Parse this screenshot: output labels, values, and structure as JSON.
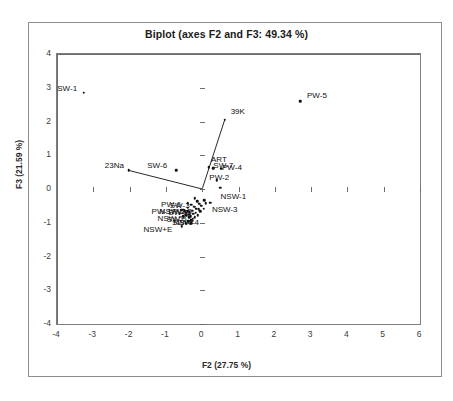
{
  "chart_data": {
    "type": "scatter",
    "title": "Biplot (axes F2 and F3: 49.34 %)",
    "xlabel": "F2 (27.75 %)",
    "ylabel": "F3 (21.59 %)",
    "xlim": [
      -4,
      6
    ],
    "ylim": [
      -4,
      4
    ],
    "xticks": [
      "-4",
      "-3",
      "-2",
      "-1",
      "0",
      "1",
      "2",
      "3",
      "4",
      "5",
      "6"
    ],
    "xtick_values": [
      -4,
      -3,
      -2,
      -1,
      0,
      1,
      2,
      3,
      4,
      5,
      6
    ],
    "yticks": [
      "4",
      "3",
      "2",
      "1",
      "0",
      "-1",
      "-2",
      "-3",
      "-4"
    ],
    "ytick_values": [
      4,
      3,
      2,
      1,
      0,
      -1,
      -2,
      -3,
      -4
    ],
    "grid": false,
    "legend": "none",
    "observations": [
      {
        "label": "SW-1",
        "x": -3.26,
        "y": 2.85,
        "lx": -3.72,
        "ly": 3.0,
        "anchor": "left"
      },
      {
        "label": "PW-5",
        "x": 2.7,
        "y": 2.6,
        "lx": 3.16,
        "ly": 2.8,
        "anchor": "left"
      },
      {
        "label": "SW-6",
        "x": -0.72,
        "y": 0.56,
        "lx": -1.24,
        "ly": 0.7,
        "anchor": "left"
      },
      {
        "label": "ART",
        "x": 0.18,
        "y": 0.65,
        "lx": 0.46,
        "ly": 0.88,
        "anchor": "left"
      },
      {
        "label": "SW-7",
        "x": 0.3,
        "y": 0.62,
        "lx": 0.58,
        "ly": 0.71,
        "anchor": "left"
      },
      {
        "label": "PW-4",
        "x": 0.52,
        "y": 0.6,
        "lx": 0.82,
        "ly": 0.66,
        "anchor": "left"
      },
      {
        "label": "PW-2",
        "x": 0.4,
        "y": 0.26,
        "lx": 0.47,
        "ly": 0.37,
        "anchor": "left"
      },
      {
        "label": "NSW-1",
        "x": 0.5,
        "y": 0.04,
        "lx": 0.86,
        "ly": -0.22,
        "anchor": "left"
      },
      {
        "label": "NSW-3",
        "x": 0.22,
        "y": -0.4,
        "lx": 0.62,
        "ly": -0.6,
        "anchor": "left"
      },
      {
        "label": "PW-6",
        "x": -0.4,
        "y": -0.42,
        "lx": -0.86,
        "ly": -0.44,
        "anchor": "left"
      },
      {
        "label": "SW-3",
        "x": -0.3,
        "y": -0.47,
        "lx": -0.62,
        "ly": -0.48,
        "anchor": "left"
      },
      {
        "label": "PW-1",
        "x": -0.52,
        "y": -0.62,
        "lx": -1.12,
        "ly": -0.64,
        "anchor": "left"
      },
      {
        "label": "NSW-2",
        "x": -0.46,
        "y": -0.64,
        "lx": -0.82,
        "ly": -0.65,
        "anchor": "left"
      },
      {
        "label": "SW-2",
        "x": -0.38,
        "y": -0.66,
        "lx": -0.66,
        "ly": -0.68,
        "anchor": "left"
      },
      {
        "label": "PW-3",
        "x": -0.34,
        "y": -0.7,
        "lx": -0.56,
        "ly": -0.66,
        "anchor": "left"
      },
      {
        "label": "NSW-5",
        "x": -0.44,
        "y": -0.78,
        "lx": -0.88,
        "ly": -0.86,
        "anchor": "left"
      },
      {
        "label": "SW-5",
        "x": -0.36,
        "y": -0.84,
        "lx": -0.7,
        "ly": -0.88,
        "anchor": "left"
      },
      {
        "label": "SW-4",
        "x": -0.3,
        "y": -0.92,
        "lx": -0.56,
        "ly": -0.97,
        "anchor": "left"
      },
      {
        "label": "NSW-4",
        "x": -0.26,
        "y": -0.94,
        "lx": -0.44,
        "ly": -0.99,
        "anchor": "left"
      },
      {
        "label": "NSW+E",
        "x": -0.56,
        "y": -1.1,
        "lx": -1.22,
        "ly": -1.18,
        "anchor": "left"
      }
    ],
    "extra_points": [
      {
        "x": -0.2,
        "y": -0.28
      },
      {
        "x": -0.14,
        "y": -0.36
      },
      {
        "x": -0.08,
        "y": -0.44
      },
      {
        "x": -0.22,
        "y": -0.52
      },
      {
        "x": -0.16,
        "y": -0.58
      },
      {
        "x": -0.1,
        "y": -0.6
      },
      {
        "x": -0.28,
        "y": -0.64
      },
      {
        "x": -0.06,
        "y": -0.66
      },
      {
        "x": -0.18,
        "y": -0.7
      },
      {
        "x": -0.24,
        "y": -0.74
      },
      {
        "x": -0.12,
        "y": -0.78
      },
      {
        "x": -0.32,
        "y": -0.8
      },
      {
        "x": -0.2,
        "y": -0.84
      },
      {
        "x": -0.26,
        "y": -0.88
      },
      {
        "x": -0.4,
        "y": -0.56
      },
      {
        "x": -0.44,
        "y": -0.7
      },
      {
        "x": -0.36,
        "y": -0.76
      },
      {
        "x": -0.48,
        "y": -0.66
      },
      {
        "x": -0.52,
        "y": -0.8
      },
      {
        "x": -0.3,
        "y": -1.02
      },
      {
        "x": -0.02,
        "y": -0.5
      },
      {
        "x": 0.04,
        "y": -0.58
      },
      {
        "x": -0.58,
        "y": -0.62
      },
      {
        "x": -0.62,
        "y": -0.74
      },
      {
        "x": 0.1,
        "y": -0.42
      },
      {
        "x": 0.06,
        "y": -0.34
      },
      {
        "x": -0.38,
        "y": -0.96
      },
      {
        "x": -0.46,
        "y": -1.02
      }
    ],
    "vectors": [
      {
        "label": "39K",
        "x": 0.62,
        "y": 2.05,
        "lx": 0.98,
        "ly": 2.3
      },
      {
        "label": "23Na",
        "x": -2.02,
        "y": 0.55,
        "lx": -2.42,
        "ly": 0.72
      }
    ]
  }
}
